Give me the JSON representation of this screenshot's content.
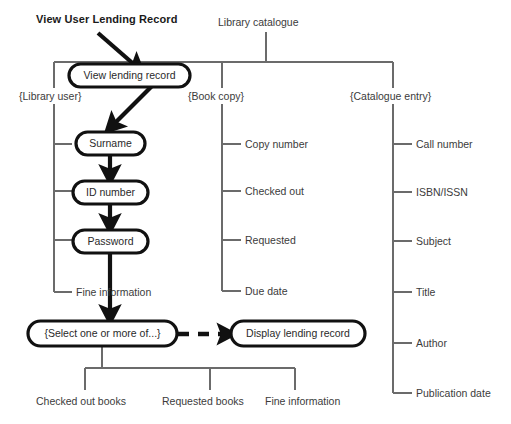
{
  "diagram": {
    "title": "View User Lending Record",
    "root_label": "Library catalogue",
    "start_node": "View lending record",
    "groups": [
      {
        "name": "{Library user}"
      },
      {
        "name": "{Book copy}"
      },
      {
        "name": "{Catalogue entry}"
      }
    ],
    "library_user_attributes": [
      "Surname",
      "ID number",
      "Password",
      "Fine information"
    ],
    "book_copy_attributes": [
      "Copy number",
      "Checked out",
      "Requested",
      "Due date"
    ],
    "catalogue_entry_attributes": [
      "Call number",
      "ISBN/ISSN",
      "Subject",
      "Title",
      "Author",
      "Publication date"
    ],
    "select_node": "{Select one or more of...}",
    "display_node": "Display lending record",
    "select_options": [
      "Checked out books",
      "Requested books",
      "Fine information"
    ],
    "colors": {
      "node_stroke": "#111111",
      "node_fill": "#ffffff",
      "tree_line": "#6b6b6b",
      "flow_arrow": "#111111",
      "text": "#3b3b3b",
      "title_text": "#1a1a1a"
    }
  }
}
